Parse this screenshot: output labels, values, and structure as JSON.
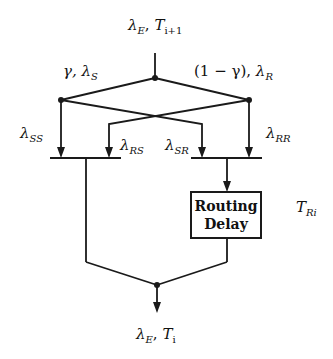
{
  "diagram": {
    "input": {
      "symbol": "λ",
      "sub": "E",
      "sep": ", ",
      "t_symbol": "T",
      "t_sub": "i+1"
    },
    "left_branch": {
      "prefix": "γ, ",
      "symbol": "λ",
      "sub": "S"
    },
    "right_branch": {
      "prefix": "(1 − γ), ",
      "symbol": "λ",
      "sub": "R"
    },
    "flows": [
      {
        "symbol": "λ",
        "sub": "SS"
      },
      {
        "symbol": "λ",
        "sub": "RS"
      },
      {
        "symbol": "λ",
        "sub": "SR"
      },
      {
        "symbol": "λ",
        "sub": "RR"
      }
    ],
    "delay_box": {
      "line1": "Routing",
      "line2": "Delay"
    },
    "delay_time": {
      "symbol": "T",
      "sub": "Ri"
    },
    "output": {
      "symbol": "λ",
      "sub": "E",
      "sep": ", ",
      "t_symbol": "T",
      "t_sub": "i"
    },
    "colors": {
      "stroke": "#1a1a1a",
      "background": "#ffffff"
    }
  }
}
